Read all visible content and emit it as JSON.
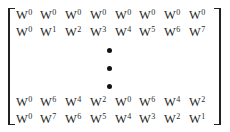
{
  "matrix": {
    "base": "W",
    "rows_top": [
      [
        "0",
        "0",
        "0",
        "0",
        "0",
        "0",
        "0",
        "0"
      ],
      [
        "0",
        "1",
        "2",
        "3",
        "4",
        "5",
        "6",
        "7"
      ]
    ],
    "rows_bottom": [
      [
        "0",
        "6",
        "4",
        "2",
        "0",
        "6",
        "4",
        "2"
      ],
      [
        "0",
        "7",
        "6",
        "5",
        "4",
        "3",
        "2",
        "1"
      ]
    ],
    "ellipsis": "vertical-dots"
  }
}
